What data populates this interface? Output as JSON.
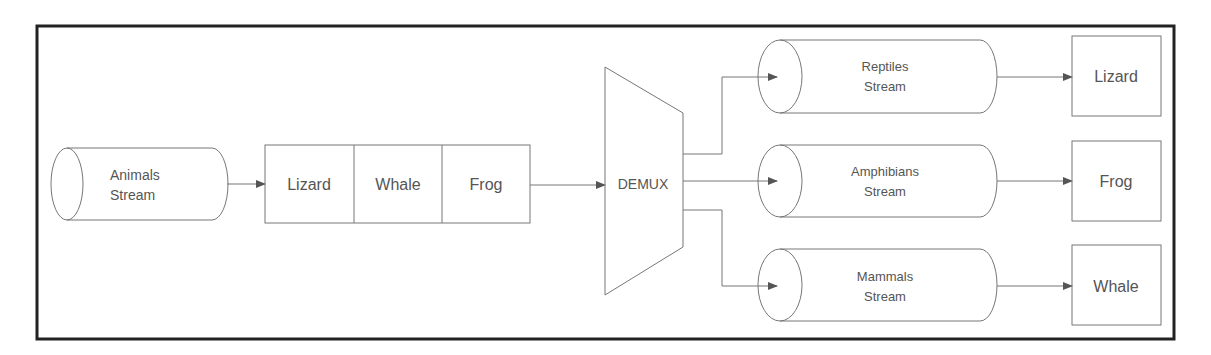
{
  "diagram": {
    "source": {
      "line1": "Animals",
      "line2": "Stream"
    },
    "queue": {
      "items": [
        "Lizard",
        "Whale",
        "Frog"
      ]
    },
    "demux": {
      "label": "DEMUX"
    },
    "streams": [
      {
        "line1": "Reptiles",
        "line2": "Stream",
        "output": "Lizard"
      },
      {
        "line1": "Amphibians",
        "line2": "Stream",
        "output": "Frog"
      },
      {
        "line1": "Mammals",
        "line2": "Stream",
        "output": "Whale"
      }
    ],
    "colors": {
      "frame": "#222222",
      "stroke": "#777777",
      "text": "#555555",
      "arrow": "#555555"
    }
  }
}
